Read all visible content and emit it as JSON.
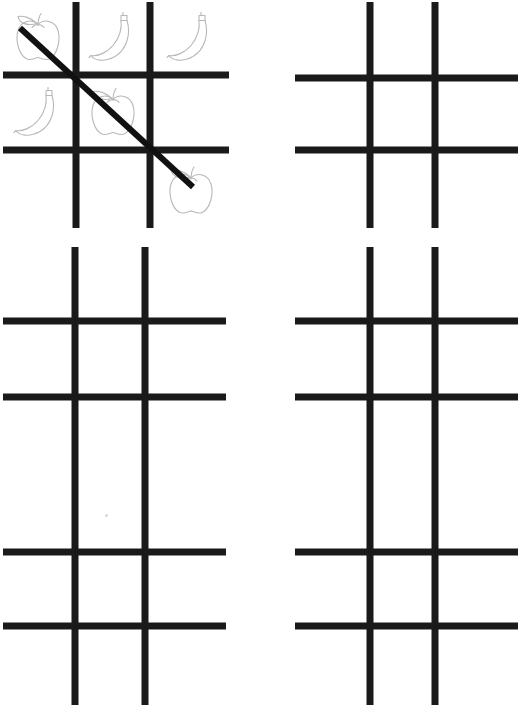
{
  "page": {
    "width": 521,
    "height": 709,
    "background_color": "#ffffff",
    "grid_line_color": "#1a1a1a",
    "strike_line_color": "#111111",
    "fruit_outline_color": "#b8b8b8",
    "artifact_dot_color": "#d8d8d8"
  },
  "boards": [
    {
      "id": "board-1",
      "name": "board-top-left",
      "position": {
        "x": 0,
        "y": 0,
        "width": 232,
        "height": 232
      },
      "line_thickness": 7,
      "col_lines": [
        76,
        150
      ],
      "row_lines": [
        75,
        150
      ],
      "marks": [
        {
          "cell": "top-left",
          "symbol": "apple"
        },
        {
          "cell": "top-center",
          "symbol": "banana"
        },
        {
          "cell": "top-right",
          "symbol": "banana"
        },
        {
          "cell": "middle-left",
          "symbol": "banana"
        },
        {
          "cell": "middle-center",
          "symbol": "apple"
        },
        {
          "cell": "middle-right",
          "symbol": ""
        },
        {
          "cell": "bottom-left",
          "symbol": ""
        },
        {
          "cell": "bottom-center",
          "symbol": ""
        },
        {
          "cell": "bottom-right",
          "symbol": "apple"
        }
      ],
      "strike": {
        "present": true,
        "from": {
          "x": 20,
          "y": 28
        },
        "to": {
          "x": 193,
          "y": 187
        },
        "thickness": 6,
        "direction": "diagonal-top-left-to-bottom-right"
      }
    },
    {
      "id": "board-2",
      "name": "board-top-right",
      "position": {
        "x": 292,
        "y": 0,
        "width": 229,
        "height": 232
      },
      "line_thickness": 7,
      "col_lines": [
        78,
        143
      ],
      "row_lines": [
        78,
        150
      ],
      "marks": [],
      "strike": {
        "present": false
      }
    },
    {
      "id": "board-3",
      "name": "board-middle-left",
      "position": {
        "x": 0,
        "y": 245,
        "width": 229,
        "height": 235
      },
      "line_thickness": 7,
      "col_lines": [
        75,
        145
      ],
      "row_lines": [
        76,
        152
      ],
      "marks": [],
      "strike": {
        "present": false
      }
    },
    {
      "id": "board-4",
      "name": "board-middle-right",
      "position": {
        "x": 292,
        "y": 245,
        "width": 229,
        "height": 235
      },
      "line_thickness": 7,
      "col_lines": [
        78,
        143
      ],
      "row_lines": [
        76,
        152
      ],
      "marks": [],
      "strike": {
        "present": false
      }
    },
    {
      "id": "board-5",
      "name": "board-bottom-left",
      "position": {
        "x": 0,
        "y": 474,
        "width": 229,
        "height": 235
      },
      "line_thickness": 7,
      "col_lines": [
        75,
        145
      ],
      "row_lines": [
        78,
        152
      ],
      "marks": [],
      "strike": {
        "present": false
      }
    },
    {
      "id": "board-6",
      "name": "board-bottom-right",
      "position": {
        "x": 292,
        "y": 474,
        "width": 229,
        "height": 235
      },
      "line_thickness": 7,
      "col_lines": [
        78,
        143
      ],
      "row_lines": [
        78,
        152
      ],
      "marks": [],
      "strike": {
        "present": false
      }
    }
  ],
  "artifacts": [
    {
      "name": "stray-dot",
      "x": 105,
      "y": 514
    }
  ]
}
